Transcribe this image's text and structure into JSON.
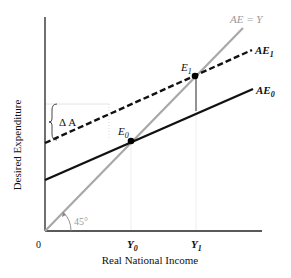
{
  "diagram": {
    "y_axis_label": "Desired Expenditure",
    "x_axis_label": "Real National Income",
    "origin_label": "0",
    "angle_label": "45°",
    "delta_label": "Δ A",
    "curves": {
      "ae_y": {
        "label": "AE = Y",
        "style": "solid",
        "color": "#a8a8a8"
      },
      "ae1": {
        "label_main": "AE",
        "label_sub": "1",
        "style": "dashed",
        "color": "#111111"
      },
      "ae0": {
        "label_main": "AE",
        "label_sub": "0",
        "style": "solid",
        "color": "#111111"
      }
    },
    "points": {
      "e0": {
        "label_main": "E",
        "label_sub": "0"
      },
      "e1": {
        "label_main": "E",
        "label_sub": "1"
      }
    },
    "x_ticks": {
      "y0": {
        "label_main": "Y",
        "label_sub": "0"
      },
      "y1": {
        "label_main": "Y",
        "label_sub": "1"
      }
    }
  }
}
